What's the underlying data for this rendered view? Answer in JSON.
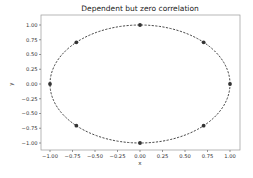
{
  "chart_data": {
    "type": "line",
    "title": "Dependent but zero correlation",
    "xlabel": "x",
    "ylabel": "y",
    "xlim": [
      -1.1,
      1.1
    ],
    "ylim": [
      -1.1,
      1.1
    ],
    "grid": false,
    "legend": null,
    "xticks": [
      -1.0,
      -0.75,
      -0.5,
      -0.25,
      0.0,
      0.25,
      0.5,
      0.75,
      1.0
    ],
    "xtick_labels": [
      "−1.00",
      "−0.75",
      "−0.50",
      "−0.25",
      "0.00",
      "0.25",
      "0.50",
      "0.75",
      "1.00"
    ],
    "yticks": [
      1.0,
      0.75,
      0.5,
      0.25,
      0.0,
      -0.25,
      -0.5,
      -0.75,
      -1.0
    ],
    "ytick_labels": [
      "1.00",
      "0.75",
      "0.50",
      "0.25",
      "0.00",
      "−0.25",
      "−0.50",
      "−0.75",
      "−1.00"
    ],
    "series": [
      {
        "name": "unit circle",
        "style": "dashed",
        "color": "#333333",
        "description": "x = cos(t), y = sin(t), t in [0, 2π]"
      },
      {
        "name": "points",
        "style": "markers",
        "color": "#333333",
        "x": [
          1.0,
          0.707,
          0.0,
          -0.707,
          -1.0,
          -0.707,
          0.0,
          0.707
        ],
        "y": [
          0.0,
          0.707,
          1.0,
          0.707,
          0.0,
          -0.707,
          -1.0,
          -0.707
        ]
      }
    ]
  }
}
